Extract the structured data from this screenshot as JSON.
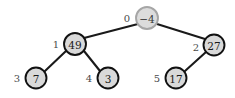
{
  "figure": {
    "width": 235,
    "height": 98,
    "background": "#ffffff",
    "edge_color": "#1a1a1a",
    "node_fill": "#d9d9d9",
    "node_stroke": "#111111",
    "root_stroke": "#a6a6a6",
    "index_label_color": "#4a4a4a"
  },
  "chart_data": {
    "type": "diagram",
    "diagram_kind": "binary-tree",
    "title": "",
    "nodes": [
      {
        "index": "0",
        "value": "−4",
        "cx": 147,
        "cy": 18,
        "r": 11,
        "index_x": 127,
        "index_y": 18,
        "is_root": true
      },
      {
        "index": "1",
        "value": "49",
        "cx": 75,
        "cy": 44,
        "r": 11,
        "index_x": 56,
        "index_y": 44,
        "is_root": false
      },
      {
        "index": "2",
        "value": "27",
        "cx": 214,
        "cy": 45,
        "r": 10.5,
        "index_x": 196,
        "index_y": 47,
        "is_root": false
      },
      {
        "index": "3",
        "value": "7",
        "cx": 36,
        "cy": 78,
        "r": 10.5,
        "index_x": 17,
        "index_y": 78,
        "is_root": false
      },
      {
        "index": "4",
        "value": "3",
        "cx": 108,
        "cy": 78,
        "r": 10.5,
        "index_x": 89,
        "index_y": 78,
        "is_root": false
      },
      {
        "index": "5",
        "value": "17",
        "cx": 176,
        "cy": 78,
        "r": 10.5,
        "index_x": 157,
        "index_y": 78,
        "is_root": false
      }
    ],
    "edges": [
      {
        "from": "0",
        "to": "1",
        "x1": 138,
        "y1": 24,
        "x2": 84,
        "y2": 38
      },
      {
        "from": "0",
        "to": "2",
        "x1": 157,
        "y1": 24,
        "x2": 205,
        "y2": 39
      },
      {
        "from": "1",
        "to": "3",
        "x1": 66,
        "y1": 51,
        "x2": 45,
        "y2": 71
      },
      {
        "from": "1",
        "to": "4",
        "x1": 84,
        "y1": 51,
        "x2": 100,
        "y2": 71
      },
      {
        "from": "2",
        "to": "5",
        "x1": 206,
        "y1": 52,
        "x2": 185,
        "y2": 71
      }
    ]
  }
}
